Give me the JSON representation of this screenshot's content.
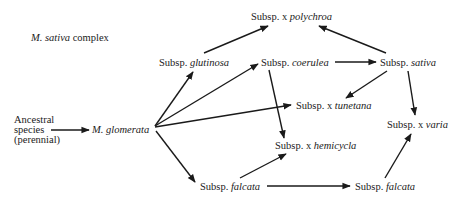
{
  "diagram": {
    "title_italic": "M. sativa",
    "title_rest": " complex",
    "nodes": {
      "ancestral": {
        "line1": "Ancestral",
        "line2": "species",
        "line3": "(perennial)"
      },
      "glomerata": {
        "prefix": "",
        "italic": "M. glomerata"
      },
      "glutinosa": {
        "prefix": "Subsp. ",
        "italic": "glutinosa"
      },
      "polychroa": {
        "prefix": "Subsp. x ",
        "italic": "polychroa"
      },
      "coerulea": {
        "prefix": "Subsp. ",
        "italic": "coerulea"
      },
      "sativa": {
        "prefix": "Subsp. ",
        "italic": "sativa"
      },
      "tunetana": {
        "prefix": "Subsp. x ",
        "italic": "tunetana"
      },
      "varia": {
        "prefix": "Subsp. x ",
        "italic": "varia"
      },
      "hemicycla": {
        "prefix": "Subsp. x ",
        "italic": "hemicycla"
      },
      "falcata_left": {
        "prefix": "Subsp. ",
        "italic": "falcata"
      },
      "falcata_right": {
        "prefix": "Subsp. ",
        "italic": "falcata"
      }
    },
    "edges": [
      {
        "from": "ancestral",
        "to": "glomerata"
      },
      {
        "from": "glomerata",
        "to": "glutinosa"
      },
      {
        "from": "glomerata",
        "to": "coerulea"
      },
      {
        "from": "glomerata",
        "to": "tunetana"
      },
      {
        "from": "glomerata",
        "to": "falcata_left"
      },
      {
        "from": "glutinosa",
        "to": "polychroa"
      },
      {
        "from": "sativa",
        "to": "polychroa"
      },
      {
        "from": "coerulea",
        "to": "sativa"
      },
      {
        "from": "coerulea",
        "to": "hemicycla"
      },
      {
        "from": "sativa",
        "to": "tunetana"
      },
      {
        "from": "sativa",
        "to": "varia"
      },
      {
        "from": "falcata_left",
        "to": "hemicycla"
      },
      {
        "from": "falcata_left",
        "to": "falcata_right"
      },
      {
        "from": "falcata_right",
        "to": "varia"
      }
    ],
    "line_color": "#1a1a1a"
  }
}
